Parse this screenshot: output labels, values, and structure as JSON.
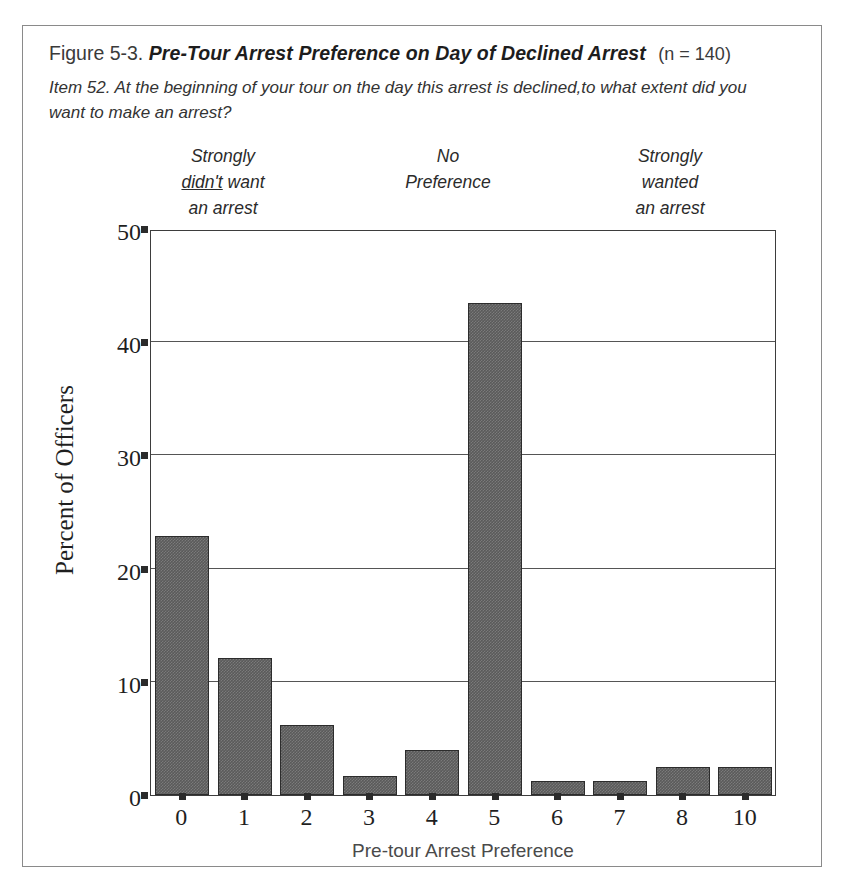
{
  "figure": {
    "number": "Figure 5-3.",
    "title": "Pre-Tour Arrest Preference on Day of Declined Arrest",
    "sample": "(n = 140)",
    "item_text": "Item 52. At the beginning of your tour on the day this arrest is declined,to what extent did you want to make an arrest?"
  },
  "anchors": {
    "left": {
      "line1": "Strongly",
      "line2_underlined": "didn't",
      "line2_rest": " want",
      "line3": "an arrest"
    },
    "center": {
      "line1": "No",
      "line2": "Preference"
    },
    "right": {
      "line1": "Strongly",
      "line2": "wanted",
      "line3": "an arrest"
    }
  },
  "colors": {
    "bar_fill": "#5a5a5a",
    "bar_border": "#2c2c2c",
    "axis": "#3d3d3d",
    "gridline": "#555555",
    "card_border": "#8a8a8a"
  },
  "chart_data": {
    "type": "bar",
    "title": "Pre-Tour Arrest Preference on Day of Declined Arrest",
    "xlabel": "Pre-tour Arrest Preference",
    "ylabel": "Percent of Officers",
    "categories": [
      "0",
      "1",
      "2",
      "3",
      "4",
      "5",
      "6",
      "7",
      "8",
      "10"
    ],
    "values": [
      22.9,
      12.1,
      6.2,
      1.7,
      4.0,
      43.5,
      1.2,
      1.2,
      2.5,
      2.5
    ],
    "ylim": [
      0,
      50
    ],
    "yticks": [
      0,
      10,
      20,
      30,
      40,
      50
    ],
    "ytick_labels": [
      "0",
      "10",
      "20",
      "30",
      "40",
      "50"
    ],
    "grid": true,
    "legend": "none",
    "n": 140
  }
}
